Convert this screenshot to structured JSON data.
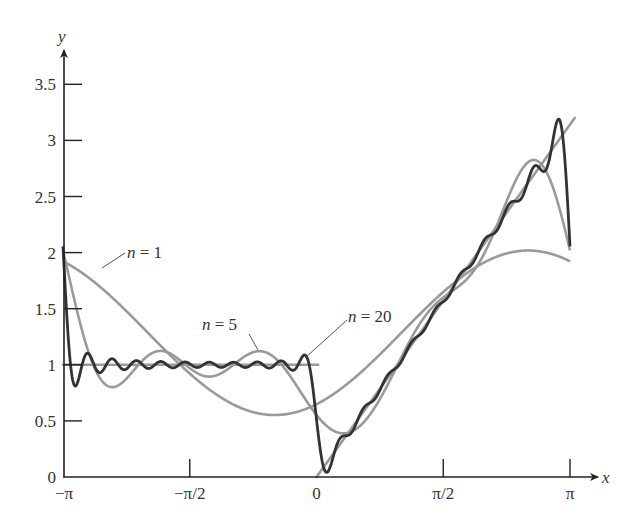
{
  "chart_data": {
    "type": "line",
    "title": "",
    "xlabel": "x",
    "ylabel": "y",
    "xlim": [
      -3.14159,
      3.2
    ],
    "ylim": [
      0,
      3.7
    ],
    "grid": false,
    "legend": "inline annotations",
    "x_ticks": [
      {
        "value": -3.14159,
        "label": "−π"
      },
      {
        "value": -1.5708,
        "label": "−π/2"
      },
      {
        "value": 0,
        "label": "0"
      },
      {
        "value": 1.5708,
        "label": "π/2"
      },
      {
        "value": 3.14159,
        "label": "π"
      }
    ],
    "y_ticks": [
      {
        "value": 0,
        "label": "0"
      },
      {
        "value": 0.5,
        "label": "0.5"
      },
      {
        "value": 1,
        "label": "1"
      },
      {
        "value": 1.5,
        "label": "1.5"
      },
      {
        "value": 2,
        "label": "2"
      },
      {
        "value": 2.5,
        "label": "2.5"
      },
      {
        "value": 3,
        "label": "3"
      },
      {
        "value": 3.5,
        "label": "3.5"
      }
    ],
    "function": {
      "description": "f(x) = 1 for -π < x < 0, f(x) = x for 0 < x < π",
      "segments": [
        {
          "x": [
            -3.14159,
            0.02
          ],
          "y": [
            1,
            1
          ]
        },
        {
          "x": [
            0,
            3.2
          ],
          "y": [
            0,
            3.2
          ]
        }
      ],
      "color": "#9a9a9a"
    },
    "fourier": {
      "a0_half": 1.2854,
      "a_odd": "-2/(π k²)",
      "a_even": "0",
      "b_odd": "(π-2)/(π k)",
      "b_even": "-1/k"
    },
    "x_samples": [
      "-π",
      "-7π/8",
      "-3π/4",
      "-5π/8",
      "-π/2",
      "-3π/8",
      "-π/4",
      "-π/8",
      "0",
      "π/8",
      "π/4",
      "3π/8",
      "π/2",
      "5π/8",
      "3π/4",
      "7π/8",
      "π"
    ],
    "series": [
      {
        "name": "n = 1",
        "n": 1,
        "color": "#9a9a9a",
        "width": 2.6,
        "values": [
          1.922,
          1.735,
          1.479,
          1.193,
          0.922,
          0.706,
          0.578,
          0.558,
          0.649,
          0.836,
          1.092,
          1.378,
          1.649,
          1.865,
          1.993,
          2.013,
          1.922
        ]
      },
      {
        "name": "n = 5",
        "n": 5,
        "color": "#9a9a9a",
        "width": 2.6,
        "values": [
          2.018,
          0.95,
          0.86,
          1.08,
          0.97,
          0.93,
          1.07,
          0.8,
          0.553,
          0.55,
          0.95,
          1.3,
          1.6,
          1.95,
          2.459,
          2.813,
          2.018
        ]
      },
      {
        "name": "n = 20",
        "n": 20,
        "color": "#333333",
        "width": 2.8,
        "values": [
          2.07,
          1.0,
          1.0,
          1.0,
          1.0,
          1.0,
          1.0,
          1.0,
          0.5,
          0.39,
          0.78,
          1.18,
          1.57,
          1.96,
          2.36,
          2.75,
          2.07
        ]
      }
    ],
    "annotations": [
      {
        "n_label": "n",
        "rest": " = 1",
        "text_x": 127,
        "text_y": 258,
        "leader": [
          [
            125,
            253
          ],
          [
            102,
            268
          ]
        ]
      },
      {
        "n_label": "n",
        "rest": " = 5",
        "text_x": 202,
        "text_y": 330,
        "leader": [
          [
            249,
            334
          ],
          [
            258,
            350
          ]
        ]
      },
      {
        "n_label": "n",
        "rest": " = 20",
        "text_x": 348,
        "text_y": 322,
        "leader": [
          [
            347,
            320
          ],
          [
            305,
            358
          ]
        ]
      }
    ]
  }
}
